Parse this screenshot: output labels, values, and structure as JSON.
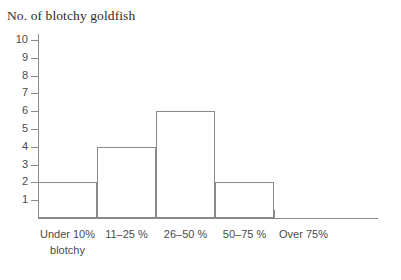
{
  "chart_data": {
    "type": "bar",
    "title": "No. of blotchy goldfish",
    "xlabel": "",
    "ylabel": "No. of blotchy goldfish",
    "categories": [
      "Under 10% blotchy",
      "11–25 %",
      "26–50 %",
      "50–75 %",
      "Over 75%"
    ],
    "category_lines": [
      [
        "Under 10%",
        "blotchy"
      ],
      [
        "11–25 %",
        ""
      ],
      [
        "26–50 %",
        ""
      ],
      [
        "50–75 %",
        ""
      ],
      [
        "Over 75%",
        ""
      ]
    ],
    "values": [
      2,
      4,
      6,
      2,
      0
    ],
    "ylim": [
      0,
      10
    ],
    "ytick_labels": [
      "10",
      "9",
      "8",
      "7",
      "6",
      "5",
      "4",
      "3",
      "2",
      "1"
    ],
    "ytick_values": [
      10,
      9,
      8,
      7,
      6,
      5,
      4,
      3,
      2,
      1
    ],
    "grid": false,
    "legend": false,
    "bar_style": "outline",
    "colors": {
      "line": "#8a8a8a",
      "text": "#4a4a4a",
      "title": "#2b2b2b",
      "background": "#ffffff"
    }
  }
}
